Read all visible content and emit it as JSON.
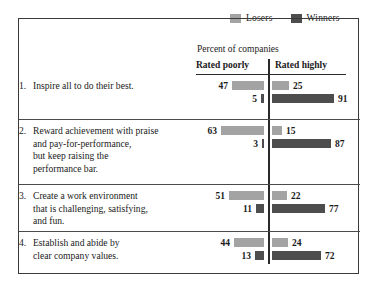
{
  "legend": {
    "items": [
      {
        "label": "Losers",
        "color": "#a3a3a3",
        "icon": "square-swatch-icon"
      },
      {
        "label": "Winners",
        "color": "#4d4d4d",
        "icon": "square-swatch-icon"
      }
    ]
  },
  "subtitle": "Percent of companies",
  "columns": {
    "left": "Rated poorly",
    "right": "Rated highly"
  },
  "rows": [
    {
      "number": "1.",
      "lines": [
        "Inspire all to do their best."
      ],
      "rated_poorly": {
        "losers": 47,
        "winners": 5
      },
      "rated_highly": {
        "losers": 25,
        "winners": 91
      }
    },
    {
      "number": "2.",
      "lines": [
        "Reward achievement with praise",
        "and pay-for-performance,",
        "but keep raising the",
        "performance bar."
      ],
      "rated_poorly": {
        "losers": 63,
        "winners": 3
      },
      "rated_highly": {
        "losers": 15,
        "winners": 87
      }
    },
    {
      "number": "3.",
      "lines": [
        "Create a work environment",
        "that is challenging, satisfying,",
        "and fun."
      ],
      "rated_poorly": {
        "losers": 51,
        "winners": 11
      },
      "rated_highly": {
        "losers": 22,
        "winners": 77
      }
    },
    {
      "number": "4.",
      "lines": [
        "Establish and abide by",
        "clear company values."
      ],
      "rated_poorly": {
        "losers": 44,
        "winners": 13
      },
      "rated_highly": {
        "losers": 24,
        "winners": 72
      }
    }
  ],
  "chart_data": {
    "type": "bar",
    "title": "",
    "subtitle": "Percent of companies",
    "xlabel": "Percent of companies",
    "ylabel": "",
    "orientation": "horizontal",
    "grouping": "two-panel diverging (Rated poorly | Rated highly)",
    "panels": [
      "Rated poorly",
      "Rated highly"
    ],
    "categories": [
      "1. Inspire all to do their best.",
      "2. Reward achievement with praise and pay-for-performance, but keep raising the performance bar.",
      "3. Create a work environment that is challenging, satisfying, and fun.",
      "4. Establish and abide by clear company values."
    ],
    "series": [
      {
        "name": "Losers",
        "color": "#a3a3a3",
        "panel": "Rated poorly",
        "values": [
          47,
          63,
          51,
          44
        ]
      },
      {
        "name": "Winners",
        "color": "#4d4d4d",
        "panel": "Rated poorly",
        "values": [
          5,
          3,
          11,
          13
        ]
      },
      {
        "name": "Losers",
        "color": "#a3a3a3",
        "panel": "Rated highly",
        "values": [
          25,
          15,
          22,
          24
        ]
      },
      {
        "name": "Winners",
        "color": "#4d4d4d",
        "panel": "Rated highly",
        "values": [
          91,
          87,
          77,
          72
        ]
      }
    ],
    "xlim": [
      0,
      100
    ],
    "grid": false,
    "legend_position": "top-right",
    "units": "percent"
  },
  "render": {
    "px_per_unit": 0.683,
    "divider_x": 268,
    "left_bar_right_edge": 264,
    "right_bar_left_edge": 272
  }
}
